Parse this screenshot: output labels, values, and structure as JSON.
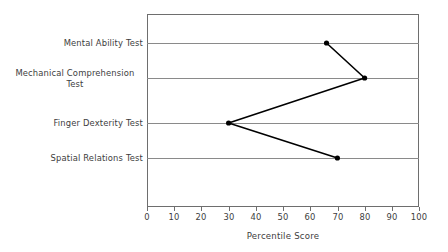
{
  "chart_data": {
    "type": "line",
    "orientation": "horizontal",
    "title": "",
    "xlabel": "Percentile Score",
    "ylabel": "",
    "xlim": [
      0,
      100
    ],
    "xticks": [
      0,
      10,
      20,
      30,
      40,
      50,
      60,
      70,
      80,
      90,
      100
    ],
    "xtick_labels": [
      "0",
      "10",
      "20",
      "30",
      "40",
      "50",
      "60",
      "70",
      "80",
      "90",
      "100"
    ],
    "grid": "horizontal-category-lines",
    "legend": "none",
    "categories": [
      "Mental Ability Test",
      "Mechanical Comprehension\nTest",
      "Finger Dexterity Test",
      "Spatial Relations Test"
    ],
    "values": [
      66,
      80,
      30,
      70
    ],
    "series": [
      {
        "name": "Percentile Score",
        "color": "#000000",
        "marker": "filled-circle",
        "points": [
          {
            "category": "Mental Ability Test",
            "value": 66
          },
          {
            "category": "Mechanical Comprehension Test",
            "value": 80
          },
          {
            "category": "Finger Dexterity Test",
            "value": 30
          },
          {
            "category": "Spatial Relations Test",
            "value": 70
          }
        ]
      }
    ],
    "colors": {
      "line": "#000000",
      "marker": "#000000",
      "gridline": "#8a8a8a",
      "frame": "#6e6e6e",
      "text": "#3d3d3d",
      "background": "#ffffff"
    }
  },
  "axis": {
    "x_title": "Percentile Score",
    "tick_0": "0",
    "tick_10": "10",
    "tick_20": "20",
    "tick_30": "30",
    "tick_40": "40",
    "tick_50": "50",
    "tick_60": "60",
    "tick_70": "70",
    "tick_80": "80",
    "tick_90": "90",
    "tick_100": "100"
  },
  "categories": {
    "c0": "Mental Ability Test",
    "c1": "Mechanical Comprehension\nTest",
    "c2": "Finger Dexterity Test",
    "c3": "Spatial Relations Test"
  }
}
